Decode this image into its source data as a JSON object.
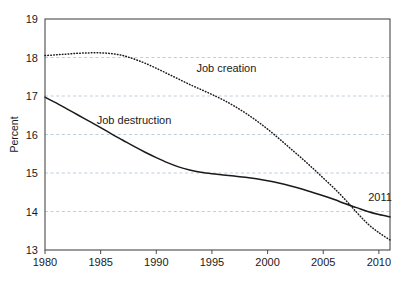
{
  "chart_data": {
    "type": "line",
    "title": "",
    "xlabel": "",
    "ylabel": "Percent",
    "xlim": [
      1980,
      2011
    ],
    "ylim": [
      13,
      19
    ],
    "xticks": [
      "1980",
      "1985",
      "1990",
      "1995",
      "2000",
      "2005",
      "2010"
    ],
    "xtick_values": [
      1980,
      1985,
      1990,
      1995,
      2000,
      2005,
      2010
    ],
    "yticks": [
      "13",
      "14",
      "15",
      "16",
      "17",
      "18",
      "19"
    ],
    "ytick_values": [
      13,
      14,
      15,
      16,
      17,
      18,
      19
    ],
    "grid": true,
    "grid_axis": "y",
    "grid_style": "dashed",
    "grid_color": "#b9c7d6",
    "frame": true,
    "legend_position": "inline-annotations",
    "annotations": [
      {
        "text": "2011",
        "x": 2010.1,
        "y": 14.28
      }
    ],
    "series": [
      {
        "name": "Job creation",
        "style": "dotted",
        "color": "#1a1a1a",
        "label_x": 1996.3,
        "label_y": 17.62,
        "x": [
          1980,
          1981,
          1982,
          1983,
          1984,
          1985,
          1986,
          1987,
          1988,
          1989,
          1990,
          1991,
          1992,
          1993,
          1994,
          1995,
          1996,
          1997,
          1998,
          1999,
          2000,
          2001,
          2002,
          2003,
          2004,
          2005,
          2006,
          2007,
          2008,
          2009,
          2010,
          2011
        ],
        "values": [
          18.05,
          18.07,
          18.09,
          18.11,
          18.12,
          18.12,
          18.1,
          18.05,
          17.96,
          17.85,
          17.72,
          17.58,
          17.44,
          17.3,
          17.17,
          17.04,
          16.9,
          16.74,
          16.56,
          16.36,
          16.14,
          15.9,
          15.65,
          15.4,
          15.14,
          14.87,
          14.6,
          14.3,
          13.98,
          13.68,
          13.45,
          13.26
        ]
      },
      {
        "name": "Job destruction",
        "style": "solid",
        "color": "#1a1a1a",
        "label_x": 1988.0,
        "label_y": 16.28,
        "x": [
          1980,
          1981,
          1982,
          1983,
          1984,
          1985,
          1986,
          1987,
          1988,
          1989,
          1990,
          1991,
          1992,
          1993,
          1994,
          1995,
          1996,
          1997,
          1998,
          1999,
          2000,
          2001,
          2002,
          2003,
          2004,
          2005,
          2006,
          2007,
          2008,
          2009,
          2010,
          2011
        ],
        "values": [
          16.97,
          16.82,
          16.66,
          16.5,
          16.34,
          16.18,
          16.01,
          15.85,
          15.69,
          15.54,
          15.4,
          15.27,
          15.16,
          15.08,
          15.02,
          14.98,
          14.95,
          14.92,
          14.89,
          14.85,
          14.8,
          14.74,
          14.67,
          14.59,
          14.5,
          14.41,
          14.31,
          14.2,
          14.1,
          14.0,
          13.92,
          13.86
        ]
      }
    ]
  },
  "plot": {
    "left": 45,
    "top": 19,
    "right": 390,
    "bottom": 250
  }
}
